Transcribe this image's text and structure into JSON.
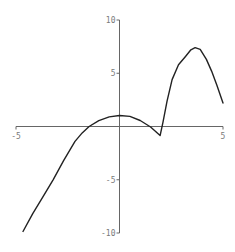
{
  "chart_data": {
    "type": "line",
    "title": "",
    "xlabel": "",
    "ylabel": "",
    "xlim": [
      -5,
      5
    ],
    "ylim": [
      -10,
      10
    ],
    "grid": false,
    "legend": null,
    "x_ticks": [
      {
        "value": -5,
        "label": "-5"
      },
      {
        "value": 5,
        "label": "5"
      }
    ],
    "y_ticks": [
      {
        "value": 10,
        "label": "10"
      },
      {
        "value": 5,
        "label": "5"
      },
      {
        "value": -5,
        "label": "-5"
      },
      {
        "value": -10,
        "label": "-10"
      }
    ],
    "series": [
      {
        "name": "f(x)",
        "color": "#222222",
        "x": [
          -4.66,
          -4.2,
          -3.7,
          -3.21,
          -2.7,
          -2.15,
          -1.8,
          -1.47,
          -1.0,
          -0.5,
          0.0,
          0.5,
          1.0,
          1.5,
          1.96,
          2.1,
          2.3,
          2.54,
          2.85,
          3.2,
          3.45,
          3.65,
          3.9,
          4.2,
          4.45,
          4.7,
          5.0
        ],
        "y": [
          -9.86,
          -8.2,
          -6.6,
          -5.0,
          -3.2,
          -1.4,
          -0.6,
          0.0,
          0.55,
          0.9,
          1.03,
          0.95,
          0.56,
          -0.05,
          -0.85,
          0.4,
          2.4,
          4.4,
          5.8,
          6.6,
          7.2,
          7.4,
          7.25,
          6.3,
          5.2,
          3.9,
          2.2
        ]
      }
    ]
  },
  "frame": {
    "width": 235,
    "height": 252,
    "plot_px": {
      "x_min": 16,
      "x_max": 223,
      "y_top": 20,
      "y_bottom": 233
    },
    "axis_color": "#666666",
    "label_color": "#7a7a7a"
  }
}
